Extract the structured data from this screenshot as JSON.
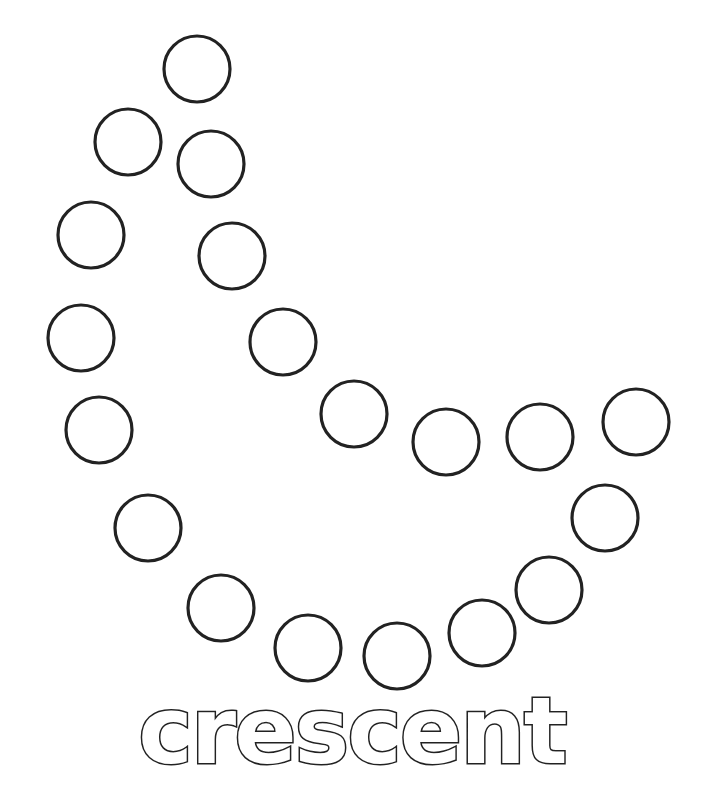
{
  "worksheet": {
    "title_word": "crescent",
    "shape": "crescent",
    "dot_radius": 33,
    "stroke_color": "#222222",
    "background_color": "#ffffff",
    "dots": [
      {
        "cx": 197,
        "cy": 69
      },
      {
        "cx": 128,
        "cy": 142
      },
      {
        "cx": 211,
        "cy": 164
      },
      {
        "cx": 91,
        "cy": 235
      },
      {
        "cx": 232,
        "cy": 256
      },
      {
        "cx": 81,
        "cy": 338
      },
      {
        "cx": 283,
        "cy": 342
      },
      {
        "cx": 99,
        "cy": 430
      },
      {
        "cx": 354,
        "cy": 414
      },
      {
        "cx": 446,
        "cy": 442
      },
      {
        "cx": 540,
        "cy": 437
      },
      {
        "cx": 636,
        "cy": 422
      },
      {
        "cx": 148,
        "cy": 528
      },
      {
        "cx": 605,
        "cy": 518
      },
      {
        "cx": 221,
        "cy": 608
      },
      {
        "cx": 549,
        "cy": 590
      },
      {
        "cx": 308,
        "cy": 648
      },
      {
        "cx": 397,
        "cy": 656
      },
      {
        "cx": 482,
        "cy": 633
      }
    ]
  }
}
